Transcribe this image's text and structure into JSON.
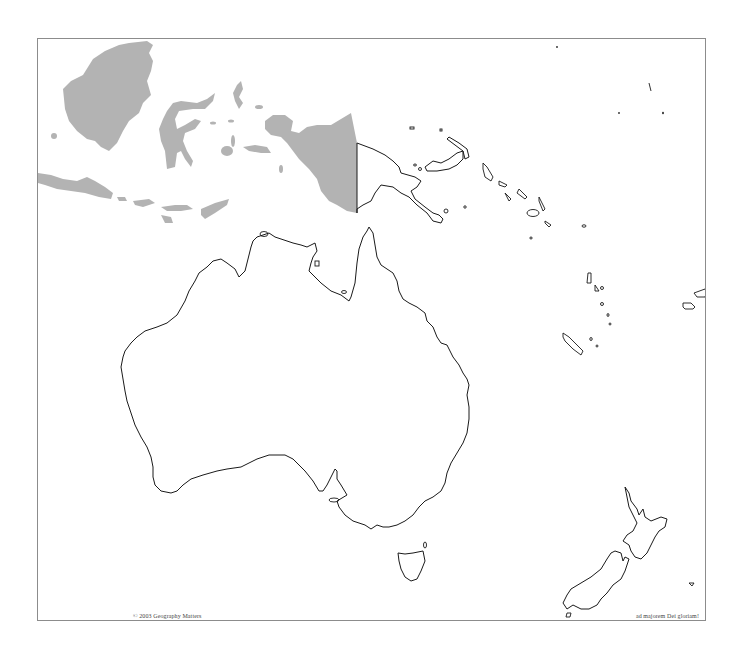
{
  "map": {
    "title": "Oceania outline map",
    "region": "Australia and Oceania",
    "highlight_color": "#b3b3b3",
    "outline_color": "#1a1a1a",
    "border_color": "#8c8c8c",
    "shaded_regions": [
      "Indonesia (Borneo, Sumatra/Java chain, Sulawesi, Maluku, Western New Guinea)"
    ],
    "outlined_regions": [
      "Australia",
      "Tasmania",
      "Papua New Guinea",
      "Solomon Islands",
      "Vanuatu",
      "New Caledonia",
      "Fiji",
      "New Zealand"
    ]
  },
  "footer": {
    "copyright": "© 2003 Geography Matters",
    "motto": "ad majorem Dei gloriam!"
  }
}
